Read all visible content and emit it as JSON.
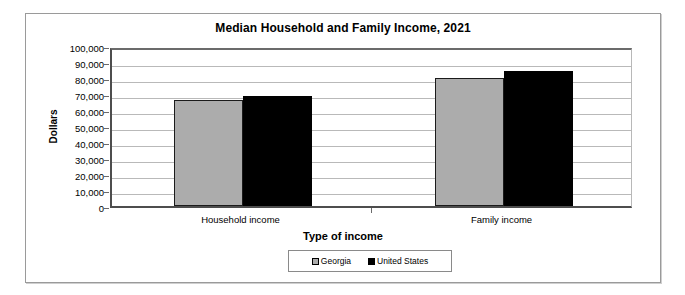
{
  "chart_data": {
    "type": "bar",
    "title": "Median Household and Family Income, 2021",
    "xlabel": "Type of income",
    "ylabel": "Dollars",
    "categories": [
      "Household income",
      "Family income"
    ],
    "series": [
      {
        "name": "Georgia",
        "color": "#acacac",
        "values": [
          66000,
          80000
        ]
      },
      {
        "name": "United States",
        "color": "#000000",
        "values": [
          69000,
          84500
        ]
      }
    ],
    "ylim": [
      0,
      100000
    ],
    "ytick_labels": [
      "100,000",
      "90,000",
      "80,000",
      "70,000",
      "60,000",
      "50,000",
      "40,000",
      "30,000",
      "20,000",
      "10,000",
      "0"
    ],
    "ytick_values": [
      100000,
      90000,
      80000,
      70000,
      60000,
      50000,
      40000,
      30000,
      20000,
      10000,
      0
    ],
    "grid": true,
    "legend_position": "bottom",
    "legend_entries": [
      "Georgia",
      "United States"
    ]
  }
}
